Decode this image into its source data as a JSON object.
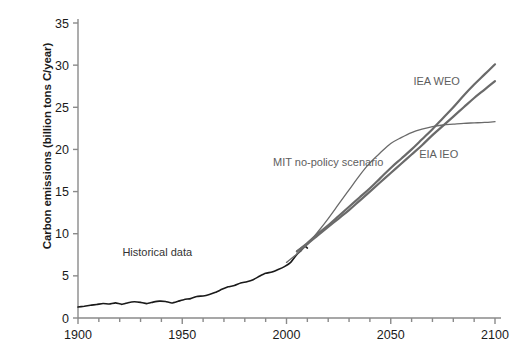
{
  "chart_data": {
    "type": "line",
    "title": "",
    "xlabel": "",
    "ylabel": "Carbon emissions (billion tons C/year)",
    "xlim": [
      1900,
      2100
    ],
    "ylim": [
      0,
      35
    ],
    "xticks": [
      "1900",
      "1950",
      "2000",
      "2050",
      "2100"
    ],
    "xtick_values": [
      1900,
      1950,
      2000,
      2050,
      2100
    ],
    "xminor_step": 10,
    "yticks": [
      "0",
      "5",
      "10",
      "15",
      "20",
      "25",
      "30",
      "35"
    ],
    "ytick_values": [
      0,
      5,
      10,
      15,
      20,
      25,
      30,
      35
    ],
    "grid": false,
    "legend_position": "inline-annotations",
    "annotations": [
      {
        "label": "Historical data",
        "x": 1938,
        "y": 7.4,
        "color": "#333333"
      },
      {
        "label": "MIT no-policy scenario",
        "x": 2020,
        "y": 18.0,
        "color": "#5e5e5e"
      },
      {
        "label": "IEA WEO",
        "x": 2072,
        "y": 27.6,
        "color": "#5e5e5e"
      },
      {
        "label": "EIA IEO",
        "x": 2073,
        "y": 19.0,
        "color": "#5e5e5e"
      }
    ],
    "series": [
      {
        "name": "Historical data",
        "color": "#1a1a1a",
        "width": 1.6,
        "x": [
          1900,
          1903,
          1906,
          1909,
          1912,
          1915,
          1918,
          1921,
          1924,
          1927,
          1930,
          1933,
          1936,
          1939,
          1942,
          1945,
          1948,
          1951,
          1954,
          1957,
          1960,
          1963,
          1966,
          1969,
          1972,
          1975,
          1978,
          1981,
          1984,
          1987,
          1990,
          1993,
          1996,
          1999,
          2002,
          2005,
          2007,
          2008,
          2009,
          2010
        ],
        "y": [
          1.3,
          1.4,
          1.52,
          1.6,
          1.72,
          1.66,
          1.8,
          1.62,
          1.82,
          1.92,
          1.85,
          1.7,
          1.88,
          2.0,
          1.96,
          1.78,
          1.98,
          2.2,
          2.3,
          2.55,
          2.62,
          2.8,
          3.05,
          3.4,
          3.7,
          3.85,
          4.15,
          4.3,
          4.55,
          4.95,
          5.3,
          5.45,
          5.75,
          6.1,
          6.6,
          7.55,
          8.0,
          8.3,
          8.5,
          8.3
        ],
        "note": "Black observed emissions record with year-to-year wiggles and a 2009 dip"
      },
      {
        "name": "MIT no-policy scenario",
        "color": "#6a6a6a",
        "width": 1.3,
        "x": [
          2000,
          2005,
          2010,
          2015,
          2020,
          2025,
          2030,
          2035,
          2040,
          2045,
          2050,
          2055,
          2060,
          2065,
          2070,
          2075,
          2080,
          2085,
          2090,
          2095,
          2100
        ],
        "y": [
          6.6,
          7.6,
          8.7,
          10.2,
          11.8,
          13.5,
          15.2,
          16.9,
          18.4,
          19.6,
          20.7,
          21.4,
          22.0,
          22.4,
          22.7,
          22.9,
          23.0,
          23.1,
          23.15,
          23.2,
          23.3
        ],
        "note": "Rises fastest mid-century then flattens near 23.3 by 2100"
      },
      {
        "name": "IEA WEO",
        "color": "#6a6a6a",
        "width": 2.2,
        "x": [
          2005,
          2010,
          2015,
          2020,
          2025,
          2030,
          2035,
          2040,
          2045,
          2050,
          2055,
          2060,
          2065,
          2070,
          2075,
          2080,
          2085,
          2090,
          2095,
          2100
        ],
        "y": [
          7.9,
          8.9,
          10.0,
          11.0,
          12.1,
          13.2,
          14.3,
          15.4,
          16.6,
          17.8,
          18.9,
          20.0,
          21.2,
          22.4,
          23.7,
          25.0,
          26.4,
          27.7,
          28.9,
          30.1
        ],
        "note": "Thick gray line reaching about 30 at 2100, highest endpoint"
      },
      {
        "name": "EIA IEO",
        "color": "#6a6a6a",
        "width": 2.2,
        "x": [
          2005,
          2010,
          2015,
          2020,
          2025,
          2030,
          2035,
          2040,
          2045,
          2050,
          2055,
          2060,
          2065,
          2070,
          2075,
          2080,
          2085,
          2090,
          2095,
          2100
        ],
        "y": [
          7.9,
          8.8,
          9.8,
          10.8,
          11.8,
          12.8,
          13.9,
          15.0,
          16.1,
          17.2,
          18.3,
          19.4,
          20.5,
          21.7,
          22.8,
          23.9,
          25.0,
          26.1,
          27.1,
          28.1
        ],
        "note": "Thick gray line reaching about 28 at 2100, crosses the MIT curve near 2072"
      }
    ],
    "crossover_note": "MIT no-policy curve is above the IEA/EIA curves from roughly 2020 to 2072, then falls below both."
  },
  "axis": {
    "tick_color": "#8a8a8a",
    "spine_color": "#8a8a8a",
    "text_color": "#1a1a1a"
  }
}
